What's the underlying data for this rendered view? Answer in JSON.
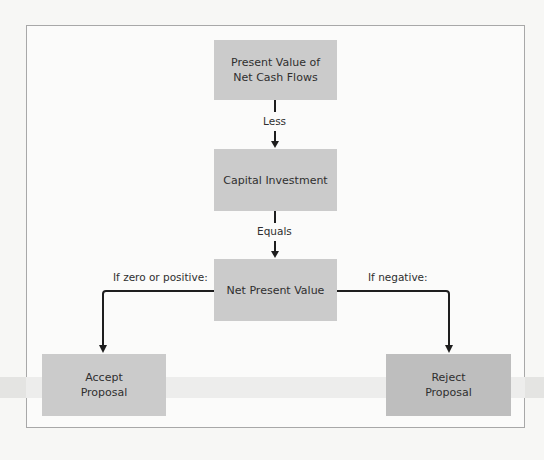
{
  "diagram": {
    "type": "flowchart",
    "nodes": {
      "pv": "Present Value of\nNet Cash Flows",
      "capital": "Capital Investment",
      "npv": "Net Present Value",
      "accept": "Accept\nProposal",
      "reject": "Reject\nProposal"
    },
    "edge_labels": {
      "less": "Less",
      "equals": "Equals",
      "zero_or_positive": "If zero or positive:",
      "negative": "If negative:"
    },
    "edges": [
      {
        "from": "pv",
        "to": "capital",
        "label": "Less"
      },
      {
        "from": "capital",
        "to": "npv",
        "label": "Equals"
      },
      {
        "from": "npv",
        "to": "accept",
        "label": "If zero or positive:"
      },
      {
        "from": "npv",
        "to": "reject",
        "label": "If negative:"
      }
    ],
    "colors": {
      "box_fill": "#cbcbcb",
      "reject_fill": "#bebebe",
      "line": "#1e1e1e",
      "frame": "#a8a8a8"
    }
  }
}
